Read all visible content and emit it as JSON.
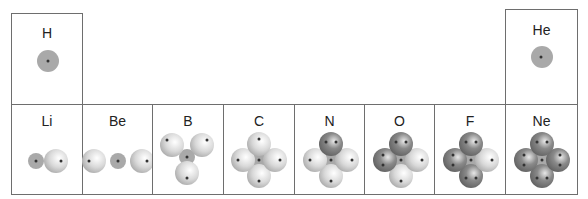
{
  "colors": {
    "border": "#6e6e6e",
    "core": "#a9a9a9",
    "lobe_light": "#d9d9d9",
    "lobe_dark": "#8a8a8a",
    "electron": "#333333"
  },
  "elements": [
    {
      "symbol": "H",
      "row": 1,
      "core_electrons": 1,
      "lobes": []
    },
    {
      "symbol": "He",
      "row": 1,
      "core_electrons": 2,
      "lobes": []
    },
    {
      "symbol": "Li",
      "row": 2,
      "core_electrons": 2,
      "lobes": [
        {
          "pos": "right",
          "electrons": 1
        }
      ]
    },
    {
      "symbol": "Be",
      "row": 2,
      "core_electrons": 2,
      "lobes": [
        {
          "pos": "left",
          "electrons": 1
        },
        {
          "pos": "right",
          "electrons": 1
        }
      ]
    },
    {
      "symbol": "B",
      "row": 2,
      "core_electrons": 2,
      "lobes": [
        {
          "pos": "upper-left",
          "electrons": 1
        },
        {
          "pos": "upper-right",
          "electrons": 1
        },
        {
          "pos": "bottom",
          "electrons": 1
        }
      ]
    },
    {
      "symbol": "C",
      "row": 2,
      "core_electrons": 2,
      "lobes": [
        {
          "pos": "top",
          "electrons": 1
        },
        {
          "pos": "left",
          "electrons": 1
        },
        {
          "pos": "right",
          "electrons": 1
        },
        {
          "pos": "bottom",
          "electrons": 1
        }
      ]
    },
    {
      "symbol": "N",
      "row": 2,
      "core_electrons": 2,
      "lobes": [
        {
          "pos": "top",
          "electrons": 2
        },
        {
          "pos": "left",
          "electrons": 1
        },
        {
          "pos": "right",
          "electrons": 1
        },
        {
          "pos": "bottom",
          "electrons": 1
        }
      ]
    },
    {
      "symbol": "O",
      "row": 2,
      "core_electrons": 2,
      "lobes": [
        {
          "pos": "top",
          "electrons": 2
        },
        {
          "pos": "left",
          "electrons": 2
        },
        {
          "pos": "right",
          "electrons": 1
        },
        {
          "pos": "bottom",
          "electrons": 1
        }
      ]
    },
    {
      "symbol": "F",
      "row": 2,
      "core_electrons": 2,
      "lobes": [
        {
          "pos": "top",
          "electrons": 2
        },
        {
          "pos": "left",
          "electrons": 2
        },
        {
          "pos": "right",
          "electrons": 1
        },
        {
          "pos": "bottom",
          "electrons": 2
        }
      ]
    },
    {
      "symbol": "Ne",
      "row": 2,
      "core_electrons": 2,
      "lobes": [
        {
          "pos": "top",
          "electrons": 2
        },
        {
          "pos": "left",
          "electrons": 2
        },
        {
          "pos": "right",
          "electrons": 2
        },
        {
          "pos": "bottom",
          "electrons": 2
        }
      ]
    }
  ]
}
